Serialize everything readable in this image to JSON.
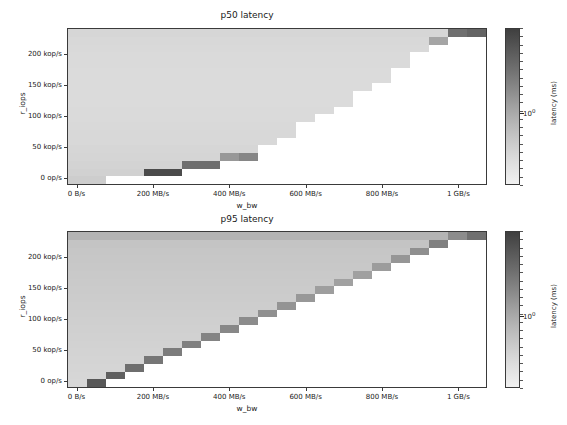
{
  "figure": {
    "width": 567,
    "height": 425,
    "background": "#ffffff"
  },
  "chart_data": [
    {
      "type": "heatmap",
      "title": "p50 latency",
      "xlabel": "w_bw",
      "ylabel": "r_iops",
      "colorbar_label": "latency (ms)",
      "colorbar_tick_labels": [
        "10⁰"
      ],
      "colorbar_scale": "log",
      "xtick_labels": [
        "0 B/s",
        "200 MB/s",
        "400 MB/s",
        "600 MB/s",
        "800 MB/s",
        "1 GB/s"
      ],
      "xtick_values": [
        0,
        200,
        400,
        600,
        800,
        1000
      ],
      "ytick_labels": [
        "0 op/s",
        "50 kop/s",
        "100 kop/s",
        "150 kop/s",
        "200 kop/s"
      ],
      "ytick_values": [
        0,
        50,
        100,
        150,
        200
      ],
      "xlim": [
        -25,
        1075
      ],
      "ylim": [
        -12,
        243
      ],
      "x_bins": 22,
      "y_bins": 20,
      "cmap": "gray_reversed",
      "vmin_gray": 235,
      "vmax_gray": 60,
      "grid": false,
      "values": [
        [
          214,
          214,
          214,
          214,
          214,
          214,
          214,
          214,
          214,
          214,
          214,
          214,
          214,
          214,
          214,
          214,
          214,
          214,
          214,
          214,
          111,
          100
        ],
        [
          216,
          216,
          216,
          216,
          216,
          216,
          216,
          216,
          216,
          216,
          216,
          216,
          216,
          216,
          216,
          216,
          216,
          216,
          216,
          165,
          null,
          null
        ],
        [
          217,
          217,
          217,
          217,
          217,
          217,
          217,
          217,
          217,
          217,
          217,
          217,
          217,
          217,
          217,
          217,
          217,
          217,
          217,
          null,
          null,
          null
        ],
        [
          218,
          218,
          218,
          218,
          218,
          218,
          218,
          218,
          218,
          218,
          218,
          218,
          218,
          218,
          218,
          218,
          218,
          218,
          null,
          null,
          null,
          null
        ],
        [
          218,
          218,
          218,
          218,
          218,
          218,
          218,
          218,
          218,
          218,
          218,
          218,
          218,
          218,
          218,
          218,
          218,
          218,
          null,
          null,
          null,
          null
        ],
        [
          219,
          219,
          219,
          219,
          219,
          219,
          219,
          219,
          219,
          219,
          219,
          219,
          219,
          219,
          219,
          219,
          219,
          null,
          null,
          null,
          null,
          null
        ],
        [
          219,
          219,
          219,
          219,
          219,
          219,
          219,
          219,
          219,
          219,
          219,
          219,
          219,
          219,
          219,
          219,
          219,
          null,
          null,
          null,
          null,
          null
        ],
        [
          219,
          219,
          219,
          219,
          219,
          219,
          219,
          219,
          219,
          219,
          219,
          219,
          219,
          219,
          219,
          219,
          null,
          null,
          null,
          null,
          null,
          null
        ],
        [
          219,
          219,
          219,
          219,
          219,
          219,
          219,
          219,
          219,
          219,
          219,
          219,
          219,
          219,
          219,
          null,
          null,
          null,
          null,
          null,
          null,
          null
        ],
        [
          219,
          219,
          219,
          219,
          219,
          219,
          219,
          219,
          219,
          219,
          219,
          219,
          219,
          219,
          219,
          null,
          null,
          null,
          null,
          null,
          null,
          null
        ],
        [
          218,
          218,
          218,
          218,
          218,
          218,
          218,
          218,
          218,
          218,
          218,
          218,
          218,
          218,
          null,
          null,
          null,
          null,
          null,
          null,
          null,
          null
        ],
        [
          218,
          218,
          218,
          218,
          218,
          218,
          218,
          218,
          218,
          218,
          218,
          218,
          218,
          null,
          null,
          null,
          null,
          null,
          null,
          null,
          null,
          null
        ],
        [
          217,
          217,
          217,
          217,
          217,
          217,
          217,
          217,
          217,
          217,
          217,
          217,
          null,
          null,
          null,
          null,
          null,
          null,
          null,
          null,
          null,
          null
        ],
        [
          216,
          216,
          216,
          216,
          216,
          216,
          216,
          216,
          216,
          216,
          216,
          216,
          null,
          null,
          null,
          null,
          null,
          null,
          null,
          null,
          null,
          null
        ],
        [
          216,
          216,
          216,
          216,
          216,
          216,
          216,
          216,
          216,
          216,
          216,
          null,
          null,
          null,
          null,
          null,
          null,
          null,
          null,
          null,
          null,
          null
        ],
        [
          214,
          214,
          214,
          214,
          214,
          214,
          214,
          214,
          214,
          214,
          null,
          null,
          null,
          null,
          null,
          null,
          null,
          null,
          null,
          null,
          null,
          null
        ],
        [
          213,
          213,
          213,
          213,
          213,
          213,
          213,
          213,
          152,
          134,
          null,
          null,
          null,
          null,
          null,
          null,
          null,
          null,
          null,
          null,
          null,
          null
        ],
        [
          211,
          211,
          211,
          211,
          211,
          211,
          110,
          110,
          null,
          null,
          null,
          null,
          null,
          null,
          null,
          null,
          null,
          null,
          null,
          null,
          null,
          null
        ],
        [
          209,
          209,
          209,
          209,
          75,
          75,
          null,
          null,
          null,
          null,
          null,
          null,
          null,
          null,
          null,
          null,
          null,
          null,
          null,
          null,
          null,
          null
        ],
        [
          205,
          205,
          null,
          null,
          null,
          null,
          null,
          null,
          null,
          null,
          null,
          null,
          null,
          null,
          null,
          null,
          null,
          null,
          null,
          null,
          null,
          null
        ]
      ]
    },
    {
      "type": "heatmap",
      "title": "p95 latency",
      "xlabel": "w_bw",
      "ylabel": "r_iops",
      "colorbar_label": "latency (ms)",
      "colorbar_tick_labels": [
        "10⁰"
      ],
      "colorbar_scale": "log",
      "xtick_labels": [
        "0 B/s",
        "200 MB/s",
        "400 MB/s",
        "600 MB/s",
        "800 MB/s",
        "1 GB/s"
      ],
      "xtick_values": [
        0,
        200,
        400,
        600,
        800,
        1000
      ],
      "ytick_labels": [
        "0 op/s",
        "50 kop/s",
        "100 kop/s",
        "150 kop/s",
        "200 kop/s"
      ],
      "ytick_values": [
        0,
        50,
        100,
        150,
        200
      ],
      "xlim": [
        -25,
        1075
      ],
      "ylim": [
        -12,
        243
      ],
      "x_bins": 22,
      "y_bins": 20,
      "cmap": "gray_reversed",
      "vmin_gray": 235,
      "vmax_gray": 60,
      "grid": false,
      "values": [
        [
          180,
          180,
          180,
          180,
          180,
          180,
          180,
          180,
          180,
          180,
          180,
          180,
          180,
          180,
          180,
          180,
          180,
          180,
          180,
          180,
          140,
          112
        ],
        [
          196,
          196,
          196,
          196,
          196,
          196,
          196,
          196,
          196,
          196,
          196,
          196,
          196,
          196,
          196,
          196,
          196,
          196,
          196,
          128,
          null,
          null
        ],
        [
          198,
          198,
          198,
          198,
          198,
          198,
          198,
          198,
          198,
          198,
          198,
          198,
          198,
          198,
          198,
          198,
          198,
          198,
          143,
          null,
          null,
          null
        ],
        [
          199,
          199,
          199,
          199,
          199,
          199,
          199,
          199,
          199,
          199,
          199,
          199,
          199,
          199,
          199,
          199,
          199,
          150,
          null,
          null,
          null,
          null
        ],
        [
          200,
          200,
          200,
          200,
          200,
          200,
          200,
          200,
          200,
          200,
          200,
          200,
          200,
          200,
          200,
          200,
          156,
          null,
          null,
          null,
          null,
          null
        ],
        [
          201,
          201,
          201,
          201,
          201,
          201,
          201,
          201,
          201,
          201,
          201,
          201,
          201,
          201,
          201,
          160,
          null,
          null,
          null,
          null,
          null,
          null
        ],
        [
          202,
          202,
          202,
          202,
          202,
          202,
          202,
          202,
          202,
          202,
          202,
          202,
          202,
          202,
          161,
          null,
          null,
          null,
          null,
          null,
          null,
          null
        ],
        [
          203,
          203,
          203,
          203,
          203,
          203,
          203,
          203,
          203,
          203,
          203,
          203,
          203,
          158,
          null,
          null,
          null,
          null,
          null,
          null,
          null,
          null
        ],
        [
          204,
          204,
          204,
          204,
          204,
          204,
          204,
          204,
          204,
          204,
          204,
          204,
          152,
          null,
          null,
          null,
          null,
          null,
          null,
          null,
          null,
          null
        ],
        [
          205,
          205,
          205,
          205,
          205,
          205,
          205,
          205,
          205,
          205,
          205,
          148,
          null,
          null,
          null,
          null,
          null,
          null,
          null,
          null,
          null,
          null
        ],
        [
          206,
          206,
          206,
          206,
          206,
          206,
          206,
          206,
          206,
          206,
          144,
          null,
          null,
          null,
          null,
          null,
          null,
          null,
          null,
          null,
          null,
          null
        ],
        [
          207,
          207,
          207,
          207,
          207,
          207,
          207,
          207,
          207,
          140,
          null,
          null,
          null,
          null,
          null,
          null,
          null,
          null,
          null,
          null,
          null,
          null
        ],
        [
          208,
          208,
          208,
          208,
          208,
          208,
          208,
          208,
          136,
          null,
          null,
          null,
          null,
          null,
          null,
          null,
          null,
          null,
          null,
          null,
          null,
          null
        ],
        [
          209,
          209,
          209,
          209,
          209,
          209,
          209,
          132,
          null,
          null,
          null,
          null,
          null,
          null,
          null,
          null,
          null,
          null,
          null,
          null,
          null,
          null
        ],
        [
          210,
          210,
          210,
          210,
          210,
          210,
          128,
          null,
          null,
          null,
          null,
          null,
          null,
          null,
          null,
          null,
          null,
          null,
          null,
          null,
          null,
          null
        ],
        [
          211,
          211,
          211,
          211,
          211,
          124,
          null,
          null,
          null,
          null,
          null,
          null,
          null,
          null,
          null,
          null,
          null,
          null,
          null,
          null,
          null,
          null
        ],
        [
          212,
          212,
          212,
          212,
          118,
          null,
          null,
          null,
          null,
          null,
          null,
          null,
          null,
          null,
          null,
          null,
          null,
          null,
          null,
          null,
          null,
          null
        ],
        [
          213,
          213,
          213,
          110,
          null,
          null,
          null,
          null,
          null,
          null,
          null,
          null,
          null,
          null,
          null,
          null,
          null,
          null,
          null,
          null,
          null,
          null
        ],
        [
          214,
          214,
          96,
          null,
          null,
          null,
          null,
          null,
          null,
          null,
          null,
          null,
          null,
          null,
          null,
          null,
          null,
          null,
          null,
          null,
          null,
          null
        ],
        [
          215,
          88,
          null,
          null,
          null,
          null,
          null,
          null,
          null,
          null,
          null,
          null,
          null,
          null,
          null,
          null,
          null,
          null,
          null,
          null,
          null,
          null
        ]
      ]
    }
  ]
}
